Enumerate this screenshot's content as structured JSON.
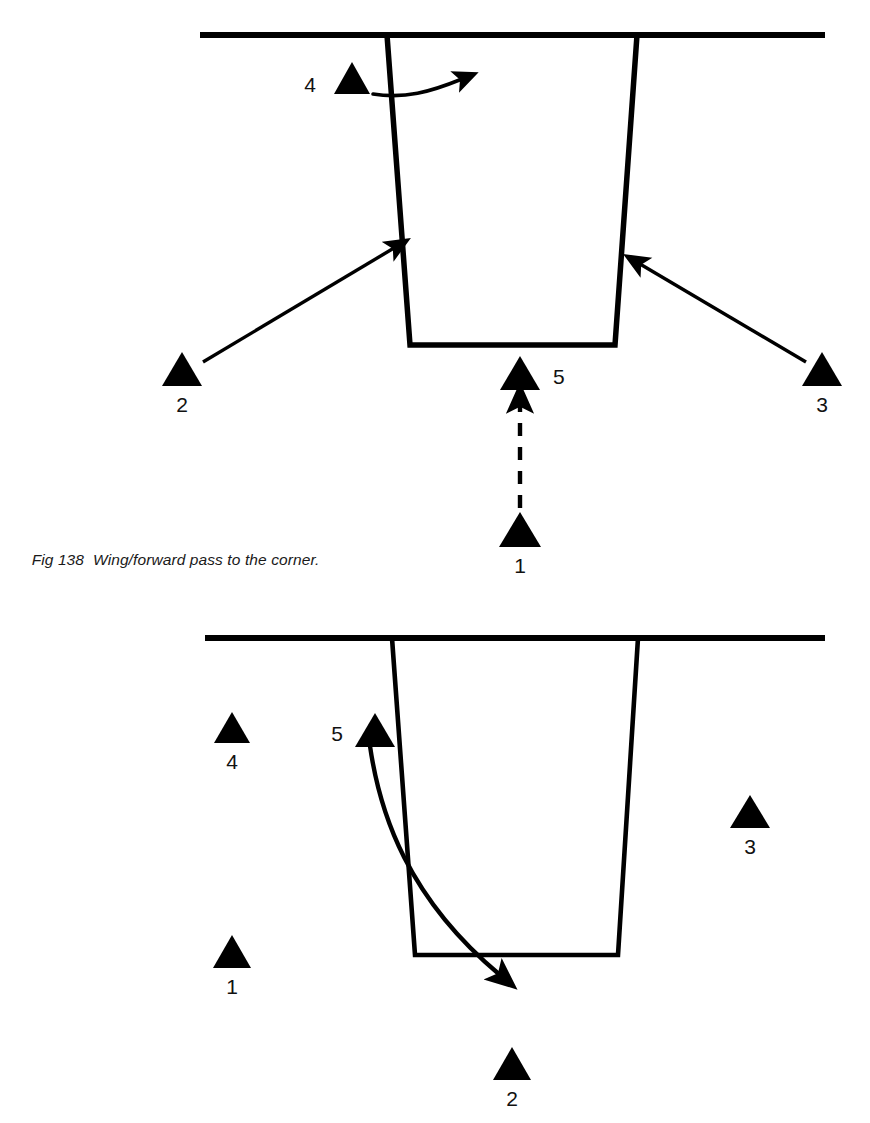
{
  "figure": {
    "number": "Fig 138",
    "caption_text": "Wing/forward pass to the corner.",
    "caption_full": "Fig 138  Wing/forward pass to the corner."
  },
  "colors": {
    "ink": "#000000",
    "background": "#ffffff",
    "label_ink": "#111111"
  },
  "diagrams": [
    {
      "id": "top",
      "name": "wing-forward-pass-to-the-corner-setup",
      "rink_features": {
        "goal_line": {
          "x1": 200,
          "y1": 35,
          "x2": 825,
          "y2": 35,
          "label": "goal-line"
        },
        "trapezoid": {
          "label": "goalie-trapezoid",
          "top_left_x": 387,
          "top_right_x": 637,
          "bottom_left_x": 410,
          "bottom_right_x": 615,
          "top_y": 35,
          "bottom_y": 345
        }
      },
      "players": [
        {
          "id": "p1",
          "label": "1",
          "x": 520,
          "y": 530,
          "label_pos": "below"
        },
        {
          "id": "p2",
          "label": "2",
          "x": 182,
          "y": 368,
          "label_pos": "below"
        },
        {
          "id": "p3",
          "label": "3",
          "x": 822,
          "y": 368,
          "label_pos": "below"
        },
        {
          "id": "p4",
          "label": "4",
          "x": 352,
          "y": 80,
          "label_pos": "left"
        },
        {
          "id": "p5",
          "label": "5",
          "x": 520,
          "y": 372,
          "label_pos": "right"
        }
      ],
      "movements": [
        {
          "id": "m-p4-curve",
          "type": "curved-skate-arrow",
          "from": "4",
          "to": "right",
          "style": "solid"
        },
        {
          "id": "m-p2-corner",
          "type": "straight-skate-arrow",
          "from": "2",
          "to": "left-corner",
          "style": "solid"
        },
        {
          "id": "m-p3-corner",
          "type": "straight-skate-arrow",
          "from": "3",
          "to": "right-corner",
          "style": "solid"
        },
        {
          "id": "m-p1-pass",
          "type": "pass-arrow",
          "from": "1",
          "to": "5",
          "style": "dashed"
        }
      ]
    },
    {
      "id": "bottom",
      "name": "wing-forward-pass-follow-up",
      "rink_features": {
        "goal_line": {
          "x1": 205,
          "y1": 38,
          "x2": 825,
          "y2": 38,
          "label": "goal-line"
        },
        "trapezoid": {
          "label": "goalie-trapezoid",
          "top_left_x": 392,
          "top_right_x": 638,
          "bottom_left_x": 415,
          "bottom_right_x": 618,
          "top_y": 38,
          "bottom_y": 355
        }
      },
      "players": [
        {
          "id": "p1",
          "label": "1",
          "x": 232,
          "y": 352,
          "label_pos": "below"
        },
        {
          "id": "p2",
          "label": "2",
          "x": 512,
          "y": 463,
          "label_pos": "below"
        },
        {
          "id": "p3",
          "label": "3",
          "x": 750,
          "y": 212,
          "label_pos": "below"
        },
        {
          "id": "p4",
          "label": "4",
          "x": 232,
          "y": 128,
          "label_pos": "below"
        },
        {
          "id": "p5",
          "label": "5",
          "x": 375,
          "y": 130,
          "label_pos": "left"
        }
      ],
      "movements": [
        {
          "id": "m-p5-drive",
          "type": "curved-skate-arrow",
          "from": "5",
          "to": "front-of-net",
          "style": "solid"
        }
      ]
    }
  ]
}
